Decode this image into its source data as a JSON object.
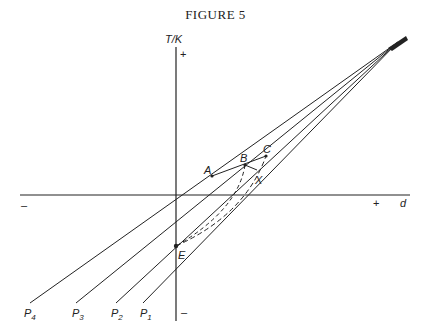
{
  "figure": {
    "title": "FIGURE 5"
  },
  "axes": {
    "y_label": "T/K",
    "x_label": "d",
    "y_plus": "+",
    "y_minus": "–",
    "x_plus": "+",
    "x_minus": "–"
  },
  "lines": [
    {
      "label": "P",
      "sub": "4"
    },
    {
      "label": "P",
      "sub": "3"
    },
    {
      "label": "P",
      "sub": "2"
    },
    {
      "label": "P",
      "sub": "1"
    }
  ],
  "points": {
    "A": "A",
    "B": "B",
    "C": "C",
    "X": "X",
    "E": "E"
  },
  "colors": {
    "ink": "#222222",
    "background": "#ffffff"
  }
}
